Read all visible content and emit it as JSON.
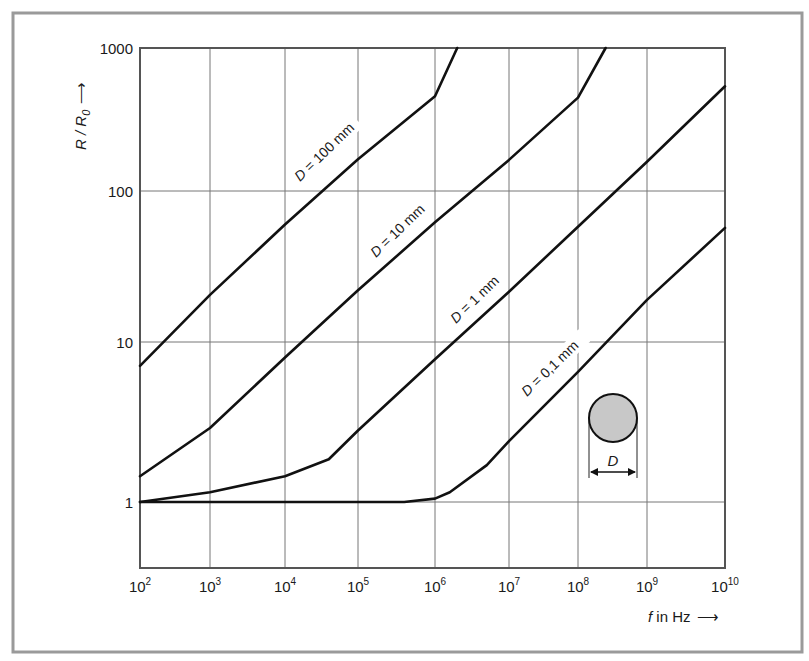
{
  "chart_data": {
    "type": "line",
    "title": "",
    "xlabel": "f in Hz",
    "ylabel": "R / R0",
    "xscale": "log",
    "yscale": "log",
    "xlim": [
      100,
      10000000000
    ],
    "ylim": [
      0.4,
      1000
    ],
    "grid": true,
    "legend": "inline labels on curves",
    "x_ticks": [
      "10^2",
      "10^3",
      "10^4",
      "10^5",
      "10^6",
      "10^7",
      "10^8",
      "10^9",
      "10^10"
    ],
    "y_ticks": [
      "1",
      "10",
      "100",
      "1000"
    ],
    "series": [
      {
        "name": "D = 100 mm",
        "points_log10f_ratio": [
          [
            2,
            7.1
          ],
          [
            3,
            20.5
          ],
          [
            4,
            60
          ],
          [
            5,
            167
          ],
          [
            6,
            460
          ],
          [
            6.3,
            1000
          ]
        ]
      },
      {
        "name": "D = 10 mm",
        "points_log10f_ratio": [
          [
            2,
            1.45
          ],
          [
            3,
            2.9
          ],
          [
            4,
            8
          ],
          [
            5,
            22
          ],
          [
            6,
            62
          ],
          [
            7,
            165
          ],
          [
            8,
            450
          ],
          [
            8.4,
            1000
          ]
        ]
      },
      {
        "name": "D = 1 mm",
        "points_log10f_ratio": [
          [
            2,
            1.0
          ],
          [
            3,
            1.15
          ],
          [
            4,
            1.45
          ],
          [
            4.6,
            1.85
          ],
          [
            5,
            2.8
          ],
          [
            6,
            7.8
          ],
          [
            7,
            21.5
          ],
          [
            8,
            58
          ],
          [
            9,
            160
          ],
          [
            10,
            540
          ]
        ]
      },
      {
        "name": "D = 0,1 mm",
        "points_log10f_ratio": [
          [
            2,
            1.0
          ],
          [
            5.6,
            1.0
          ],
          [
            6,
            1.05
          ],
          [
            6.2,
            1.15
          ],
          [
            6.7,
            1.7
          ],
          [
            7,
            2.4
          ],
          [
            8,
            6.5
          ],
          [
            9,
            19
          ],
          [
            10,
            57
          ]
        ]
      }
    ],
    "annotations": [
      "D = 100 mm",
      "D = 10 mm",
      "D = 1 mm",
      "D = 0,1 mm",
      "cross-section circle with diameter D"
    ]
  },
  "axes": {
    "y_label_main": "R / R",
    "y_label_sub": "0",
    "y_arrow": "⟶",
    "x_label_var": "f",
    "x_label_rest": " in Hz",
    "x_arrow": "⟶"
  },
  "ticks": {
    "y": [
      {
        "label": "1000",
        "v": 1000
      },
      {
        "label": "100",
        "v": 100
      },
      {
        "label": "10",
        "v": 10
      },
      {
        "label": "1",
        "v": 1
      }
    ],
    "x": [
      {
        "base": "10",
        "exp": "2",
        "e": 2
      },
      {
        "base": "10",
        "exp": "3",
        "e": 3
      },
      {
        "base": "10",
        "exp": "4",
        "e": 4
      },
      {
        "base": "10",
        "exp": "5",
        "e": 5
      },
      {
        "base": "10",
        "exp": "6",
        "e": 6
      },
      {
        "base": "10",
        "exp": "7",
        "e": 7
      },
      {
        "base": "10",
        "exp": "8",
        "e": 8
      },
      {
        "base": "10",
        "exp": "9",
        "e": 9
      },
      {
        "base": "10",
        "exp": "10",
        "e": 10
      }
    ]
  },
  "labels": {
    "d100": {
      "var": "D",
      "rest": " = 100 mm"
    },
    "d10": {
      "var": "D",
      "rest": " = 10 mm"
    },
    "d1": {
      "var": "D",
      "rest": " = 1 mm"
    },
    "d01": {
      "var": "D",
      "rest": " = 0,1 mm"
    }
  },
  "inset": {
    "dimension_label": "D",
    "circle_fill": "#c8c8c8"
  },
  "colors": {
    "curve": "#111111",
    "grid": "#777777",
    "frame": "#9a9a9a"
  }
}
